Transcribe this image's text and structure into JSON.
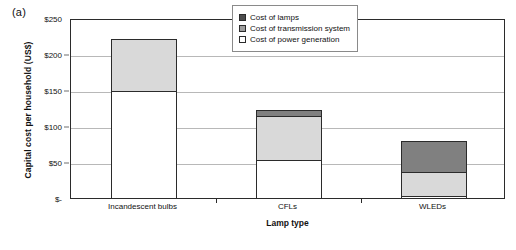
{
  "panel": {
    "label": "(a)"
  },
  "chart_data": {
    "type": "bar",
    "subtype": "stacked-bar",
    "title": "",
    "xlabel": "Lamp type",
    "ylabel": "Capital cost per household (US$)",
    "categories": [
      "Incandescent bulbs",
      "CFLs",
      "WLEDs"
    ],
    "ylim": [
      0,
      250
    ],
    "yticks": [
      0,
      50,
      100,
      150,
      200,
      250
    ],
    "ytick_labels": [
      "$-",
      "$50",
      "$100",
      "$150",
      "$200",
      "$250"
    ],
    "grid": true,
    "legend_position": "top-right",
    "series": [
      {
        "name": "Cost of power generation",
        "color": "#ffffff",
        "values": [
          150,
          55,
          5
        ]
      },
      {
        "name": "Cost of transmission system",
        "color": "#d9d9d9",
        "values": [
          75,
          63,
          35
        ]
      },
      {
        "name": "Cost of lamps",
        "color": "#808080",
        "values": [
          0,
          9,
          45
        ]
      }
    ],
    "totals": [
      225,
      127,
      85
    ]
  },
  "legend": {
    "items": [
      {
        "label": "Cost of lamps",
        "swatch": "dark-gray"
      },
      {
        "label": "Cost of transmission system",
        "swatch": "medium-gray"
      },
      {
        "label": "Cost of power generation",
        "swatch": "white"
      }
    ]
  }
}
